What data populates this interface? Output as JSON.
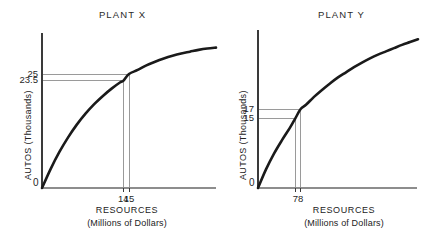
{
  "figure": {
    "background": "#ffffff",
    "ink_color": "#1a1a1a",
    "guide_color": "#9a9a9a"
  },
  "chart_data": [
    {
      "type": "line",
      "title": "PLANT X",
      "xlabel": "RESOURCES",
      "xlabel_sub": "(Millions of Dollars)",
      "ylabel": "AUTOS (Thousands)",
      "grid": false,
      "legend": false,
      "origin_label": "0",
      "xlim": [
        0,
        30
      ],
      "ylim": [
        0,
        34
      ],
      "xticks": [
        "14",
        "15"
      ],
      "xtick_values": [
        14,
        15
      ],
      "yticks": [
        "23.5",
        "25"
      ],
      "ytick_values": [
        23.5,
        25
      ],
      "annotations": [
        {
          "x": 14,
          "y": 23.5,
          "note": "14 million dollars yields 23.5 thousand autos"
        },
        {
          "x": 15,
          "y": 25,
          "note": "15 million dollars yields 25 thousand autos"
        }
      ],
      "series": [
        {
          "name": "Plant X production",
          "x": [
            0,
            1.5,
            3,
            4.5,
            6,
            7.5,
            9,
            10.5,
            12,
            13.5,
            14,
            15,
            16.5,
            18,
            19.5,
            21,
            22.5,
            24,
            25.5,
            27,
            28.5,
            30
          ],
          "y": [
            0,
            4.2,
            7.9,
            11.1,
            13.9,
            16.3,
            18.4,
            20.2,
            21.8,
            23.2,
            23.5,
            25.0,
            25.9,
            26.9,
            27.7,
            28.4,
            29.0,
            29.5,
            29.9,
            30.3,
            30.6,
            30.8
          ]
        }
      ]
    },
    {
      "type": "line",
      "title": "PLANT Y",
      "xlabel": "RESOURCES",
      "xlabel_sub": "(Millions of Dollars)",
      "ylabel": "AUTOS (Thousands)",
      "grid": false,
      "legend": false,
      "origin_label": "0",
      "xlim": [
        0,
        30
      ],
      "ylim": [
        0,
        34
      ],
      "xticks": [
        "7",
        "8"
      ],
      "xtick_values": [
        7,
        8
      ],
      "yticks": [
        "15",
        "17"
      ],
      "ytick_values": [
        15,
        17
      ],
      "annotations": [
        {
          "x": 7,
          "y": 15,
          "note": "7 million dollars yields 15 thousand autos"
        },
        {
          "x": 8,
          "y": 17,
          "note": "8 million dollars yields 17 thousand autos"
        }
      ],
      "series": [
        {
          "name": "Plant Y production",
          "x": [
            0,
            1.5,
            3,
            4.5,
            6,
            7,
            8,
            9,
            10.5,
            12,
            13.5,
            15,
            16.5,
            18,
            19.5,
            21,
            22.5,
            24,
            25.5,
            27,
            28.5,
            30
          ],
          "y": [
            0,
            4.0,
            7.4,
            10.3,
            13.0,
            15.0,
            17.0,
            17.9,
            19.6,
            21.1,
            22.5,
            23.8,
            24.9,
            26.0,
            27.0,
            27.9,
            28.7,
            29.4,
            30.1,
            30.8,
            31.4,
            32.0
          ]
        }
      ]
    }
  ]
}
